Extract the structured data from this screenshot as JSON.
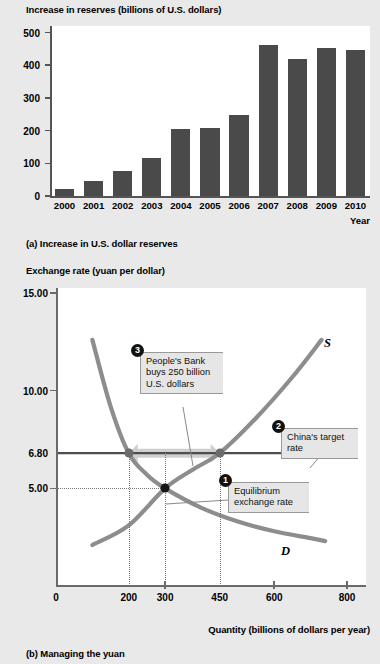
{
  "figure": {
    "panel_a": {
      "axis_title": "Increase in reserves (billions of U.S. dollars)",
      "caption": "(a) Increase in U.S. dollar reserves",
      "x_axis_name": "Year"
    },
    "panel_b": {
      "axis_title": "Exchange rate (yuan per dollar)",
      "caption": "(b) Managing the yuan",
      "x_axis_title": "Quantity (billions of dollars per year)",
      "supply_label": "S",
      "demand_label": "D",
      "callouts": [
        {
          "number": "1",
          "text": "Equilibrium\nexchange rate"
        },
        {
          "number": "2",
          "text": "China's target\nrate"
        },
        {
          "number": "3",
          "text": "People's Bank\nbuys 250 billion\nU.S. dollars"
        }
      ]
    }
  },
  "chart_data": [
    {
      "type": "bar",
      "title": "Increase in reserves (billions of U.S. dollars)",
      "xlabel": "Year",
      "ylabel": "Increase in reserves (billions of U.S. dollars)",
      "categories": [
        "2000",
        "2001",
        "2002",
        "2003",
        "2004",
        "2005",
        "2006",
        "2007",
        "2008",
        "2009",
        "2010"
      ],
      "values": [
        20,
        47,
        75,
        117,
        206,
        208,
        247,
        462,
        418,
        453,
        448
      ],
      "ylim": [
        0,
        520
      ],
      "yticks": [
        0,
        100,
        200,
        300,
        400,
        500
      ],
      "ytick_labels": [
        "0",
        "100",
        "200",
        "300",
        "400",
        "500"
      ],
      "grid": false,
      "legend": "none",
      "bar_color": "#4a4a4a"
    },
    {
      "type": "line",
      "title": "Managing the yuan",
      "xlabel": "Quantity (billions of dollars per year)",
      "ylabel": "Exchange rate (yuan per dollar)",
      "xlim": [
        0,
        800
      ],
      "ylim": [
        0,
        15
      ],
      "xticks": [
        0,
        200,
        300,
        450,
        600,
        800
      ],
      "xtick_labels": [
        "0",
        "200",
        "300",
        "450",
        "600",
        "800"
      ],
      "yticks": [
        5.0,
        6.8,
        10.0,
        15.0
      ],
      "ytick_labels": [
        "5.00",
        "6.80",
        "10.00",
        "15.00"
      ],
      "grid": false,
      "legend": "none",
      "series": [
        {
          "name": "D",
          "label": "D",
          "color": "#8d8d8d",
          "points": [
            [
              100,
              12.6
            ],
            [
              150,
              9.2
            ],
            [
              200,
              6.8
            ],
            [
              250,
              5.7
            ],
            [
              300,
              5.0
            ],
            [
              400,
              4.0
            ],
            [
              500,
              3.3
            ],
            [
              600,
              2.8
            ],
            [
              700,
              2.45
            ],
            [
              740,
              2.3
            ]
          ]
        },
        {
          "name": "S",
          "label": "S",
          "color": "#8d8d8d",
          "points": [
            [
              100,
              2.1
            ],
            [
              200,
              3.1
            ],
            [
              300,
              5.0
            ],
            [
              380,
              6.0
            ],
            [
              450,
              6.8
            ],
            [
              550,
              8.6
            ],
            [
              650,
              10.7
            ],
            [
              730,
              12.6
            ]
          ]
        }
      ],
      "horizontal_lines": [
        {
          "value": 6.8,
          "label": "China's target rate",
          "color": "#4d4d4d"
        }
      ],
      "markers": [
        {
          "x": 300,
          "y": 5.0,
          "label": "Equilibrium exchange rate",
          "color": "#151515"
        },
        {
          "x": 200,
          "y": 6.8,
          "label": "Quantity demanded at target rate",
          "color": "#6b6b6b"
        },
        {
          "x": 450,
          "y": 6.8,
          "label": "Quantity supplied at target rate",
          "color": "#6b6b6b"
        }
      ],
      "annotations": [
        {
          "number": "3",
          "text": "People's Bank buys 250 billion U.S. dollars",
          "from_x": 200,
          "to_x": 450,
          "at_y": 6.8
        },
        {
          "number": "2",
          "text": "China's target rate",
          "at_y": 6.8
        },
        {
          "number": "1",
          "text": "Equilibrium exchange rate",
          "at_x": 300,
          "at_y": 5.0
        }
      ]
    }
  ]
}
